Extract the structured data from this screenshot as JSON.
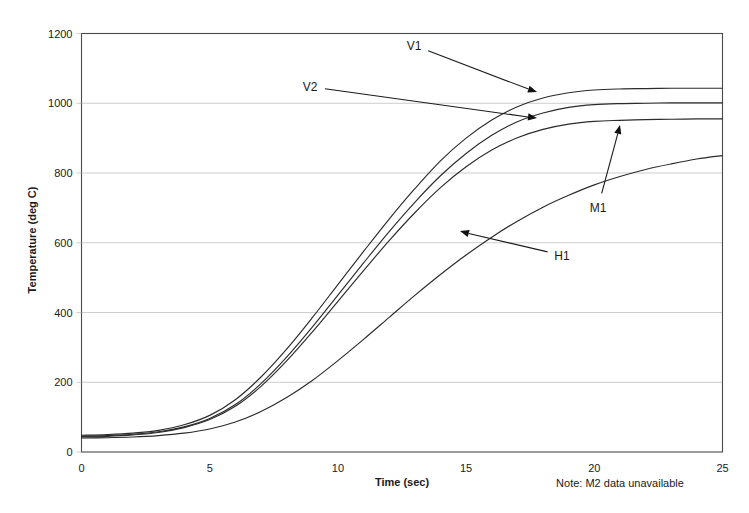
{
  "chart_data": {
    "type": "line",
    "title": "",
    "xlabel": "Time (sec)",
    "ylabel": "Temperature (deg C)",
    "xlim": [
      0,
      25
    ],
    "ylim": [
      0,
      1200
    ],
    "xticks": [
      0,
      5,
      10,
      15,
      20,
      25
    ],
    "yticks": [
      0,
      200,
      400,
      600,
      800,
      1000,
      1200
    ],
    "grid": "horizontal",
    "legend": "none-inline-annotations",
    "annotation_note": "Note: M2 data unavailable",
    "x": [
      0,
      1,
      2,
      3,
      4,
      5,
      6,
      7,
      8,
      9,
      10,
      11,
      12,
      13,
      14,
      15,
      16,
      17,
      18,
      19,
      20,
      21,
      22,
      23,
      24,
      25
    ],
    "series": [
      {
        "name": "V1",
        "label": "V1",
        "values": [
          48,
          50,
          54,
          62,
          78,
          105,
          150,
          215,
          295,
          385,
          480,
          575,
          668,
          755,
          835,
          900,
          952,
          990,
          1015,
          1030,
          1038,
          1041,
          1042,
          1043,
          1043,
          1043
        ]
      },
      {
        "name": "V2",
        "label": "V2",
        "values": [
          45,
          47,
          51,
          58,
          72,
          96,
          136,
          196,
          272,
          358,
          450,
          542,
          632,
          716,
          792,
          856,
          908,
          947,
          972,
          988,
          996,
          999,
          1000,
          1001,
          1001,
          1001
        ]
      },
      {
        "name": "M1",
        "label": "M1",
        "values": [
          43,
          45,
          49,
          56,
          70,
          93,
          131,
          188,
          261,
          344,
          432,
          520,
          606,
          686,
          758,
          818,
          866,
          901,
          925,
          940,
          948,
          951,
          953,
          954,
          955,
          955
        ]
      },
      {
        "name": "H1",
        "label": "H1",
        "values": [
          40,
          41,
          43,
          47,
          54,
          66,
          86,
          116,
          156,
          205,
          262,
          323,
          386,
          449,
          509,
          565,
          616,
          662,
          702,
          736,
          766,
          790,
          810,
          826,
          840,
          850
        ]
      }
    ],
    "annotations": [
      {
        "label": "V1",
        "label_x": 414,
        "label_y": 50,
        "tip_x": 537,
        "tip_y": 92
      },
      {
        "label": "V2",
        "label_x": 310,
        "label_y": 91,
        "tip_x": 537,
        "tip_y": 118
      },
      {
        "label": "M1",
        "label_x": 598,
        "label_y": 212,
        "tip_x": 620,
        "tip_y": 125
      },
      {
        "label": "H1",
        "label_x": 562,
        "label_y": 260,
        "tip_x": 460,
        "tip_y": 231
      }
    ]
  },
  "colors": {
    "series_stroke": "#2b2b2b",
    "gridline": "#bfbfbf",
    "frame": "#4a4a4a",
    "text": "#1a1a1a",
    "background": "#ffffff"
  }
}
